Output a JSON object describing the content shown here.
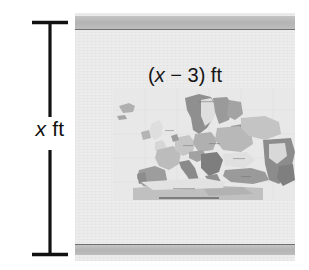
{
  "figure": {
    "type": "geometry-word-problem-diagram"
  },
  "dimensions": {
    "height_label_prefix": "x",
    "height_label_suffix": " ft",
    "height_label_full": "x ft",
    "width_label_open": "(",
    "width_label_var": "x",
    "width_label_operator": " − ",
    "width_label_value": "3",
    "width_label_close": ") ft",
    "width_label_full": "(x − 3) ft"
  },
  "photo": {
    "background_color": "#ececec",
    "band_color": "#b8b8b8",
    "band_line_color": "#6f6f6f",
    "map_alt": "grayscale political map of Europe, North Africa and the Middle East"
  },
  "colors": {
    "line": "#111111",
    "page_background": "#ffffff",
    "map_land_light": "#c9c9c9",
    "map_land_mid": "#a8a8a8",
    "map_land_dark": "#8a8a8a",
    "map_sea": "#e4e4e4"
  }
}
